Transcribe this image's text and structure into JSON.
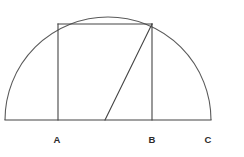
{
  "figure": {
    "type": "geometry-diagram",
    "background_color": "#ffffff",
    "stroke_color": "#444444",
    "arc_stroke_color": "#5a5a5a",
    "label_color": "#2b2b2b",
    "canvas": {
      "width": 244,
      "height": 157
    },
    "semicircle": {
      "center_x": 108,
      "center_y": 120,
      "radius": 103,
      "baseline_y": 120,
      "baseline_x_start": 5,
      "baseline_x_end": 211,
      "apex_x": 108,
      "apex_y": 17
    },
    "vertical_segments": [
      {
        "name": "left-vertical",
        "x": 58,
        "y_top": 24,
        "y_bottom": 120
      },
      {
        "name": "right-vertical",
        "x": 152,
        "y_top": 24,
        "y_bottom": 120
      }
    ],
    "chord_top": {
      "x_start": 58,
      "y_start": 24,
      "x_end": 152,
      "y_end": 24
    },
    "diagonal": {
      "x_start": 105,
      "y_start": 120,
      "x_end": 152,
      "y_end": 24
    },
    "labels": [
      {
        "id": "label-a",
        "text": "A",
        "x": 57,
        "y": 143
      },
      {
        "id": "label-b",
        "text": "B",
        "x": 152,
        "y": 143
      },
      {
        "id": "label-c",
        "text": "C",
        "x": 208,
        "y": 143
      }
    ]
  }
}
